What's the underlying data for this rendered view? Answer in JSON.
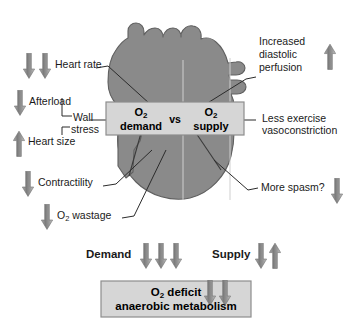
{
  "figure": {
    "colors": {
      "heart_fill": "#8a8a8a",
      "heart_stroke": "#5c5c5c",
      "box_fill": "#d6d6d6",
      "box_stroke": "#8d8d8d",
      "arrow_fill": "#8c8c8c",
      "line": "#2b2b2b",
      "text": "#111111",
      "background": "#ffffff"
    }
  },
  "center_box": {
    "demand": {
      "prefix": "O",
      "sub": "2",
      "word": "demand"
    },
    "vs": "vs",
    "supply": {
      "prefix": "O",
      "sub": "2",
      "word": "supply"
    }
  },
  "bottom_box": {
    "line1_prefix": "O",
    "line1_sub": "2",
    "line1_word": "deficit",
    "line2": "anaerobic metabolism",
    "arrows": "down-down"
  },
  "left_factors": [
    {
      "id": "heart-rate",
      "label": "Heart rate",
      "arrows": [
        "down",
        "down"
      ]
    },
    {
      "id": "afterload",
      "label": "Afterload",
      "arrows": [
        "down"
      ]
    },
    {
      "id": "wall-stress-1",
      "label": "Wall",
      "arrows": []
    },
    {
      "id": "wall-stress-2",
      "label": "stress",
      "arrows": []
    },
    {
      "id": "heart-size",
      "label": "Heart size",
      "arrows": [
        "up"
      ]
    },
    {
      "id": "contractility",
      "label": "Contractility",
      "arrows": [
        "down"
      ]
    },
    {
      "id": "o2-wastage",
      "label_prefix": "O",
      "label_sub": "2",
      "label_word": " wastage",
      "arrows": [
        "down"
      ]
    }
  ],
  "right_factors": [
    {
      "id": "increased-diastolic-perfusion",
      "line1": "Increased",
      "line2": "diastolic",
      "line3": "perfusion",
      "arrows": [
        "up"
      ]
    },
    {
      "id": "less-exercise-vasoconstriction",
      "line1": "Less exercise",
      "line2": "vasoconstriction",
      "arrows": []
    },
    {
      "id": "more-spasm",
      "line1": "More spasm?",
      "arrows": [
        "down"
      ]
    }
  ],
  "summary_row": {
    "demand_label": "Demand",
    "demand_arrows": [
      "down",
      "down",
      "down"
    ],
    "supply_label": "Supply",
    "supply_arrows": [
      "down",
      "up"
    ]
  }
}
